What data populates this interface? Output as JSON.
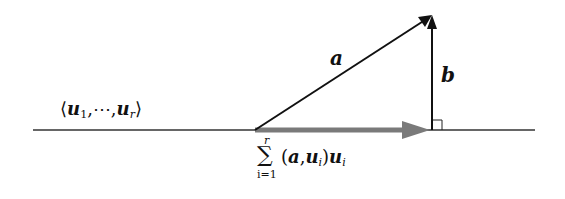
{
  "diagram": {
    "subspace_label": {
      "open": "⟨",
      "u": "u",
      "sub1": "1",
      "dots": ",⋯,",
      "sub2": "r",
      "close": "⟩"
    },
    "vector_a_label": "a",
    "vector_b_label": "b",
    "projection_label": {
      "sigma": "∑",
      "upper": "r",
      "lower": "i=1",
      "body_open": "(",
      "a": "a",
      "comma": ",",
      "u": "u",
      "sub": "i",
      "body_close": ")",
      "u2": "u",
      "sub2": "i"
    },
    "colors": {
      "line": "#222222",
      "projection_arrow": "#808080"
    }
  }
}
